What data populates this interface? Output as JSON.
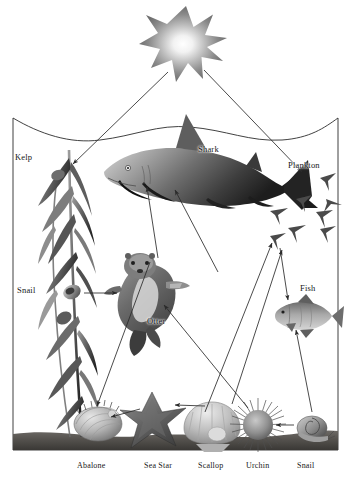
{
  "figure": {
    "type": "food-web-diagram",
    "background_color": "#ffffff",
    "border_color": "#000000",
    "ink_color": "#2b2b2b"
  },
  "labels": {
    "sun": "",
    "kelp": "Kelp",
    "snail_upper": "Snail",
    "shark": "Shark",
    "plankton": "Plankton",
    "otter": "Otter",
    "fish": "Fish",
    "abalone": "Abalone",
    "sea_star": "Sea Star",
    "scallop": "Scallop",
    "urchin": "Urchin",
    "snail_bottom": "Snail"
  },
  "organisms": [
    {
      "id": "sun",
      "label": "",
      "role": "energy-source",
      "x": 186,
      "y": 43
    },
    {
      "id": "kelp",
      "label": "Kelp",
      "role": "producer",
      "x": 64,
      "y": 300
    },
    {
      "id": "plankton",
      "label": "Plankton",
      "role": "producer",
      "x": 308,
      "y": 205
    },
    {
      "id": "shark",
      "label": "Shark",
      "role": "apex-predator",
      "x": 186,
      "y": 172
    },
    {
      "id": "otter",
      "label": "Otter",
      "role": "predator",
      "x": 138,
      "y": 293
    },
    {
      "id": "fish",
      "label": "Fish",
      "role": "consumer",
      "x": 300,
      "y": 310
    },
    {
      "id": "snail_kelp",
      "label": "Snail",
      "role": "herbivore",
      "x": 68,
      "y": 292
    },
    {
      "id": "abalone",
      "label": "Abalone",
      "role": "herbivore",
      "x": 98,
      "y": 427
    },
    {
      "id": "sea_star",
      "label": "Sea Star",
      "role": "predator",
      "x": 152,
      "y": 417
    },
    {
      "id": "scallop",
      "label": "Scallop",
      "role": "filter-feeder",
      "x": 212,
      "y": 428
    },
    {
      "id": "urchin",
      "label": "Urchin",
      "role": "herbivore",
      "x": 258,
      "y": 425
    },
    {
      "id": "snail_floor",
      "label": "Snail",
      "role": "herbivore",
      "x": 312,
      "y": 432
    }
  ],
  "arrows": [
    {
      "from": "sun",
      "to": "kelp"
    },
    {
      "from": "sun",
      "to": "plankton"
    },
    {
      "from": "otter",
      "to": "shark"
    },
    {
      "from": "fish",
      "to": "shark"
    },
    {
      "from": "snail_kelp",
      "to": "otter"
    },
    {
      "from": "urchin",
      "to": "otter"
    },
    {
      "from": "plankton",
      "to": "fish"
    },
    {
      "from": "scallop",
      "to": "sea_star"
    },
    {
      "from": "sea_star",
      "to": "abalone"
    },
    {
      "from": "snail_floor",
      "to": "urchin"
    },
    {
      "from": "snail_floor",
      "to": "fish"
    },
    {
      "from": "kelp",
      "to": "abalone"
    },
    {
      "from": "scallop",
      "to": "plankton"
    },
    {
      "from": "urchin",
      "to": "plankton"
    }
  ],
  "scene": {
    "water_surface": "wavy-line",
    "sea_floor": "dark-sediment-band",
    "frame": "rectangular-border"
  }
}
